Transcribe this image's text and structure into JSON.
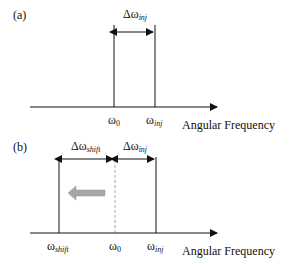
{
  "panels": [
    {
      "label": "(a)",
      "delta_inj": {
        "base": "Δω",
        "sub": "inj"
      },
      "ticks": [
        {
          "base": "ω",
          "sub": "0"
        },
        {
          "base": "ω",
          "sub": "inj"
        }
      ],
      "axis_label": "Angular Frequency"
    },
    {
      "label": "(b)",
      "delta_shift": {
        "base": "Δω",
        "sub": "shift"
      },
      "delta_inj": {
        "base": "Δω",
        "sub": "inj"
      },
      "ticks": [
        {
          "base": "ω",
          "sub": "shift"
        },
        {
          "base": "ω",
          "sub": "0"
        },
        {
          "base": "ω",
          "sub": "inj"
        }
      ],
      "axis_label": "Angular Frequency"
    }
  ],
  "colors": {
    "line": "#111111",
    "dashed": "#aaaaaa",
    "shift_arrow": "#a6a6a6"
  }
}
